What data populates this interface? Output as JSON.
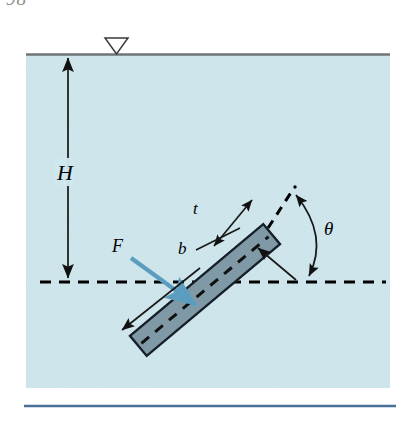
{
  "page": {
    "page_number_fragment": "98",
    "background_color": "#ffffff"
  },
  "figure": {
    "name": "inclined-submerged-plate-diagram",
    "water_panel": {
      "fill_color": "#cfe7ee",
      "surface_line_color": "#6e7579",
      "left": 26,
      "top": 54,
      "right": 390,
      "bottom": 388
    },
    "bottom_rule_color": "#4a6f96",
    "labels": {
      "depth": "H",
      "thickness": "t",
      "width": "b",
      "force": "F",
      "angle": "θ"
    },
    "plate": {
      "fill_color": "#7f9aa6",
      "edge_color": "#17202a",
      "centerline_style": "dashed",
      "angle_degrees": 40
    },
    "force_arrow_color": "#5b9dbf",
    "dashed_line_color": "#000000",
    "water_level_symbol": "inverted-triangle"
  }
}
